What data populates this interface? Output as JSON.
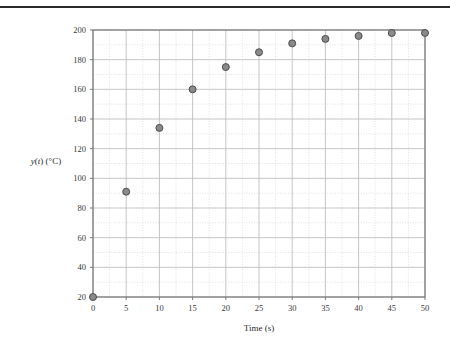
{
  "figure": {
    "background_color": "#ffffff",
    "top_rule_color": "#2b2b2b"
  },
  "chart_data": {
    "type": "scatter",
    "title": "",
    "xlabel": "Time (s)",
    "ylabel_plain": "y(t) (°C)",
    "ylabel_parts": {
      "y": "y",
      "open_paren": "(",
      "t": "t",
      "close_paren": ")",
      "units": " (°C)"
    },
    "x": [
      0,
      5,
      10,
      15,
      20,
      25,
      30,
      35,
      40,
      45,
      50
    ],
    "values": [
      20,
      91,
      134,
      160,
      175,
      185,
      191,
      194,
      196,
      198,
      198
    ],
    "series": [
      {
        "name": "y(t)",
        "marker": "circle",
        "marker_fill": "#8a8a8a",
        "marker_edge": "#4d4d4d",
        "marker_size_px": 7,
        "values": [
          20,
          91,
          134,
          160,
          175,
          185,
          191,
          194,
          196,
          198,
          198
        ]
      }
    ],
    "xlim": [
      0,
      50
    ],
    "ylim": [
      20,
      200
    ],
    "xticks": [
      0,
      5,
      10,
      15,
      20,
      25,
      30,
      35,
      40,
      45,
      50
    ],
    "yticks": [
      20,
      40,
      60,
      80,
      100,
      120,
      140,
      160,
      180,
      200
    ],
    "xtick_labels": [
      "0",
      "5",
      "10",
      "15",
      "20",
      "25",
      "30",
      "35",
      "40",
      "45",
      "50"
    ],
    "ytick_labels": [
      "20",
      "40",
      "60",
      "80",
      "100",
      "120",
      "140",
      "160",
      "180",
      "200"
    ],
    "x_minor_step": 2.5,
    "y_minor_step": 10,
    "grid": true,
    "grid_major_color": "#bfbfbf",
    "grid_minor_color": "#d9d9d9",
    "grid_minor_style": "dotted",
    "frame_color": "#6e6e6e",
    "legend": null,
    "legend_position": "none"
  }
}
